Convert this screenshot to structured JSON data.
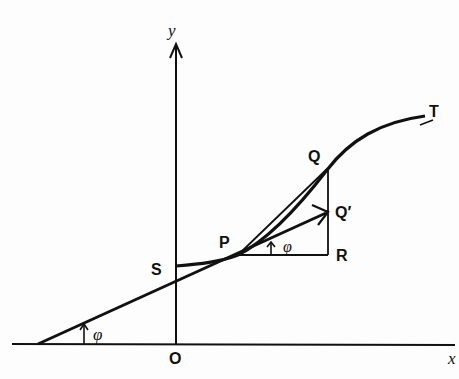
{
  "diagram": {
    "axes": {
      "x_label": "x",
      "y_label": "y",
      "origin_label": "O"
    },
    "points": {
      "S": "S",
      "P": "P",
      "Q": "Q",
      "Q_prime": "Q′",
      "R": "R",
      "T": "T"
    },
    "angles": {
      "at_P": "φ",
      "at_x_axis": "φ"
    },
    "colors": {
      "ink": "#111111",
      "background": "#fdfdfd"
    }
  }
}
